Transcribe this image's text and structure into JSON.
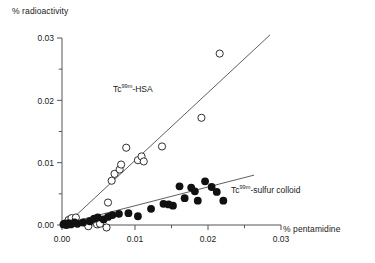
{
  "chart_data": {
    "type": "scatter",
    "title": "",
    "xlabel": "% pentamidine",
    "ylabel": "% radioactivity",
    "xlim": [
      0.0,
      0.03
    ],
    "ylim": [
      0.0,
      0.03
    ],
    "xticks": [
      "0.00",
      "0.01",
      "0.02",
      "0.03"
    ],
    "xtick_values": [
      0.0,
      0.01,
      0.02,
      0.03
    ],
    "yticks": [
      "0.00",
      "0.01",
      "0.02",
      "0.03"
    ],
    "ytick_values": [
      0.0,
      0.01,
      0.02,
      0.03
    ],
    "minor_tick_interval": 0.005,
    "grid": false,
    "legend": "inline-annotations",
    "series": [
      {
        "name": "Tc99m-HSA",
        "label_text": "Tc",
        "label_sup": "99m",
        "label_tail": "-HSA",
        "marker": "open-circle",
        "color": "#1a1a1a",
        "fit_line": {
          "x0": 0.0005,
          "y0": 0.0,
          "x1": 0.0285,
          "y1": 0.0305
        },
        "points": [
          {
            "x": 0.0003,
            "y": 0.0002
          },
          {
            "x": 0.0009,
            "y": 0.0008
          },
          {
            "x": 0.0013,
            "y": 0.0011
          },
          {
            "x": 0.0019,
            "y": 0.0012
          },
          {
            "x": 0.0036,
            "y": -0.0002
          },
          {
            "x": 0.0048,
            "y": 0.0001
          },
          {
            "x": 0.0052,
            "y": 0.0002
          },
          {
            "x": 0.0061,
            "y": -0.0004
          },
          {
            "x": 0.0063,
            "y": 0.0036
          },
          {
            "x": 0.0068,
            "y": 0.0071
          },
          {
            "x": 0.0072,
            "y": 0.0082
          },
          {
            "x": 0.0079,
            "y": 0.0089
          },
          {
            "x": 0.0081,
            "y": 0.0097
          },
          {
            "x": 0.0088,
            "y": 0.0124
          },
          {
            "x": 0.0104,
            "y": 0.0104
          },
          {
            "x": 0.0109,
            "y": 0.011
          },
          {
            "x": 0.0112,
            "y": 0.0102
          },
          {
            "x": 0.0137,
            "y": 0.0126
          },
          {
            "x": 0.0191,
            "y": 0.0172
          },
          {
            "x": 0.0216,
            "y": 0.0275
          }
        ]
      },
      {
        "name": "Tc99m-sulfur colloid",
        "label_text": "Tc",
        "label_sup": "99m",
        "label_tail": "-sulfur colloid",
        "marker": "filled-circle",
        "color": "#111111",
        "fit_line": {
          "x0": 0.0004,
          "y0": 0.0002,
          "x1": 0.0263,
          "y1": 0.008
        },
        "points": [
          {
            "x": 0.0002,
            "y": 0.0001
          },
          {
            "x": 0.0004,
            "y": 0.0002
          },
          {
            "x": 0.0006,
            "y": 0.0
          },
          {
            "x": 0.0009,
            "y": 0.0003
          },
          {
            "x": 0.0012,
            "y": 0.0001
          },
          {
            "x": 0.0017,
            "y": 0.0004
          },
          {
            "x": 0.0021,
            "y": 0.0002
          },
          {
            "x": 0.0029,
            "y": 0.0004
          },
          {
            "x": 0.0038,
            "y": 0.0006
          },
          {
            "x": 0.0044,
            "y": 0.001
          },
          {
            "x": 0.0049,
            "y": 0.0012
          },
          {
            "x": 0.0057,
            "y": 0.0009
          },
          {
            "x": 0.0063,
            "y": 0.0013
          },
          {
            "x": 0.0069,
            "y": 0.0016
          },
          {
            "x": 0.0078,
            "y": 0.0018
          },
          {
            "x": 0.0091,
            "y": 0.0019
          },
          {
            "x": 0.0104,
            "y": 0.0014
          },
          {
            "x": 0.0122,
            "y": 0.0026
          },
          {
            "x": 0.0139,
            "y": 0.0034
          },
          {
            "x": 0.0146,
            "y": 0.0033
          },
          {
            "x": 0.0152,
            "y": 0.0031
          },
          {
            "x": 0.0161,
            "y": 0.0062
          },
          {
            "x": 0.0168,
            "y": 0.0043
          },
          {
            "x": 0.0177,
            "y": 0.006
          },
          {
            "x": 0.0182,
            "y": 0.0054
          },
          {
            "x": 0.0186,
            "y": 0.0039
          },
          {
            "x": 0.0196,
            "y": 0.007
          },
          {
            "x": 0.0205,
            "y": 0.0061
          },
          {
            "x": 0.0212,
            "y": 0.0053
          },
          {
            "x": 0.0221,
            "y": 0.0039
          }
        ]
      }
    ]
  }
}
